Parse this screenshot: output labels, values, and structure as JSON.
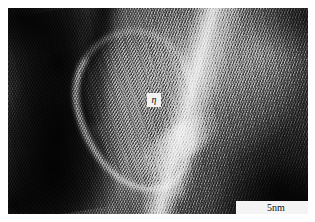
{
  "figure": {
    "kind": "hrtem-micrograph",
    "modality": "High-resolution transmission electron microscopy",
    "rendering": "grayscale"
  },
  "annotations": {
    "phase_label": {
      "text": "η",
      "box_fill": "#f2f2f2",
      "text_color": "#101010"
    },
    "scale_bar": {
      "label": "5nm",
      "value": 5,
      "unit": "nm",
      "box_fill": "#f4f4f4",
      "line_color": "#1a1a1a"
    }
  },
  "image_features": {
    "background_color": "#ffffff",
    "frame_border_color": "#2a2a2a",
    "lattice_fringes": "diagonal crossed lattice fringes across the whole field",
    "regions": [
      {
        "name": "dark-grain-left",
        "tone": "very dark"
      },
      {
        "name": "dark-lane-top-centre",
        "tone": "dark"
      },
      {
        "name": "eta-precipitate",
        "tone": "mid grey with bright rim"
      },
      {
        "name": "matrix-right",
        "tone": "mid grey"
      },
      {
        "name": "bright-diagonal-band",
        "tone": "bright"
      },
      {
        "name": "dark-corner-bottom-right",
        "tone": "very dark"
      }
    ]
  }
}
